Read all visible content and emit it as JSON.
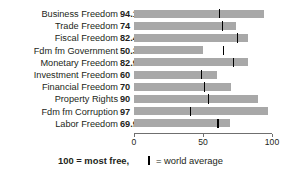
{
  "chart_data": {
    "type": "bar",
    "orientation": "horizontal",
    "title": "",
    "xlabel": "",
    "ylabel": "",
    "xlim": [
      0,
      100
    ],
    "xticks": [
      0,
      50,
      100
    ],
    "xtick_labels": [
      "0",
      "50",
      "100"
    ],
    "grid": false,
    "legend_position": "bottom",
    "categories": [
      "Business Freedom",
      "Trade Freedom",
      "Fiscal Freedom",
      "Fdm fm Government",
      "Monetary Freedom",
      "Investment Freedom",
      "Financial Freedom",
      "Property Rights",
      "Fdm fm Corruption",
      "Labor Freedom"
    ],
    "values": [
      94.1,
      74,
      82.4,
      50.3,
      82.9,
      60,
      70,
      90,
      97,
      69.9
    ],
    "value_labels": [
      "94.1",
      "74",
      "82.4",
      "50.3",
      "82.9",
      "60",
      "70",
      "90",
      "97",
      "69.9"
    ],
    "series": [
      {
        "name": "Country score",
        "values": [
          94.1,
          74,
          82.4,
          50.3,
          82.9,
          60,
          70,
          90,
          97,
          69.9
        ]
      },
      {
        "name": "World average",
        "values": [
          62,
          64,
          75,
          65,
          72,
          49,
          51,
          54,
          41,
          61
        ]
      }
    ],
    "annotations": [
      "100 = most free,",
      "= world average"
    ]
  },
  "legend": {
    "scale_note": "100 = most free,",
    "average_note": "= world average",
    "marker_name": "world-average-tick"
  },
  "colors": {
    "bar": "#a8a8a8",
    "tick": "#000000",
    "axis": "#6f6f6f",
    "text": "#231f20",
    "background": "#ffffff"
  }
}
